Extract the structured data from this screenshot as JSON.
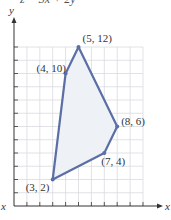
{
  "header": {
    "equation": "z = 3x + 2y"
  },
  "left_cut_label": "x",
  "chart_data": {
    "type": "line",
    "subtype": "polygon-feasible-region",
    "title": "",
    "xlabel": "x",
    "ylabel": "y",
    "xlim": [
      0,
      10
    ],
    "ylim": [
      0,
      12
    ],
    "grid": true,
    "vertices": [
      {
        "x": 3,
        "y": 2,
        "label": "(3, 2)"
      },
      {
        "x": 4,
        "y": 10,
        "label": "(4, 10)"
      },
      {
        "x": 5,
        "y": 12,
        "label": "(5, 12)"
      },
      {
        "x": 8,
        "y": 6,
        "label": "(8, 6)"
      },
      {
        "x": 7,
        "y": 4,
        "label": "(7, 4)"
      }
    ],
    "colors": {
      "line": "#5b6fa6",
      "fill": "#eef1f6",
      "grid": "#d9dbe0",
      "axis": "#333333"
    }
  }
}
